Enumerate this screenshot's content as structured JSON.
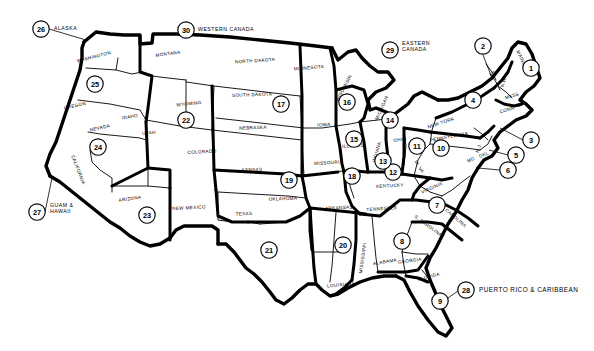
{
  "map": {
    "title": "United States Sales Territory Region Map",
    "description": "Black and white outline map of the contiguous United States divided into numbered sales regions, with state names and circled region numbers.",
    "style": {
      "background": "#ffffff",
      "line_color": "#000000",
      "text_color": "#000000"
    },
    "state_labels": [
      {
        "name": "WASHINGTON",
        "x": 94,
        "y": 57,
        "rotate": -14
      },
      {
        "name": "OREGON",
        "x": 75,
        "y": 106,
        "rotate": -13
      },
      {
        "name": "CALIFORNIA",
        "x": 78,
        "y": 170,
        "rotate": 69
      },
      {
        "name": "NEVADA",
        "x": 100,
        "y": 128,
        "rotate": -13
      },
      {
        "name": "IDAHO",
        "x": 130,
        "y": 117,
        "rotate": -10
      },
      {
        "name": "MONTANA",
        "x": 168,
        "y": 54,
        "rotate": -8
      },
      {
        "name": "WYOMING",
        "x": 189,
        "y": 104,
        "rotate": -6
      },
      {
        "name": "UTAH",
        "x": 149,
        "y": 133,
        "rotate": -5
      },
      {
        "name": "ARIZONA",
        "x": 130,
        "y": 199,
        "rotate": -8
      },
      {
        "name": "COLORADO",
        "x": 202,
        "y": 152,
        "rotate": -3
      },
      {
        "name": "NEW MEXICO",
        "x": 189,
        "y": 208,
        "rotate": -3
      },
      {
        "name": "NORTH DAKOTA",
        "x": 255,
        "y": 61,
        "rotate": -4
      },
      {
        "name": "SOUTH DAKOTA",
        "x": 252,
        "y": 95,
        "rotate": -2
      },
      {
        "name": "NEBRASKA",
        "x": 253,
        "y": 128,
        "rotate": -2
      },
      {
        "name": "KANSAS",
        "x": 252,
        "y": 170,
        "rotate": -1
      },
      {
        "name": "OKLAHOMA",
        "x": 283,
        "y": 199,
        "rotate": -2
      },
      {
        "name": "TEXAS",
        "x": 244,
        "y": 214,
        "rotate": -2
      },
      {
        "name": "MINNESOTA",
        "x": 309,
        "y": 68,
        "rotate": -5
      },
      {
        "name": "IOWA",
        "x": 324,
        "y": 125,
        "rotate": -2
      },
      {
        "name": "MISSOURI",
        "x": 327,
        "y": 163,
        "rotate": -4
      },
      {
        "name": "ARKANSAS",
        "x": 339,
        "y": 208,
        "rotate": -3
      },
      {
        "name": "LOUISIANA",
        "x": 341,
        "y": 285,
        "rotate": -5
      },
      {
        "name": "WISCONSIN",
        "x": 344,
        "y": 88,
        "rotate": -62
      },
      {
        "name": "ILLINOIS",
        "x": 353,
        "y": 146,
        "rotate": -4
      },
      {
        "name": "MICHIGAN",
        "x": 382,
        "y": 108,
        "rotate": -66
      },
      {
        "name": "INDIANA",
        "x": 377,
        "y": 152,
        "rotate": -74
      },
      {
        "name": "OHIO",
        "x": 400,
        "y": 140,
        "rotate": -6
      },
      {
        "name": "KENTUCKY",
        "x": 390,
        "y": 186,
        "rotate": -3
      },
      {
        "name": "TENNESSEE",
        "x": 382,
        "y": 209,
        "rotate": -4
      },
      {
        "name": "MISSISSIPPI",
        "x": 363,
        "y": 258,
        "rotate": -82
      },
      {
        "name": "ALABAMA",
        "x": 385,
        "y": 262,
        "rotate": -10
      },
      {
        "name": "GEORGIA",
        "x": 410,
        "y": 261,
        "rotate": -8
      },
      {
        "name": "FLORIDA",
        "x": 429,
        "y": 277,
        "rotate": -15
      },
      {
        "name": "S. CAROLINA",
        "x": 428,
        "y": 226,
        "rotate": 36
      },
      {
        "name": "N. CAROLINA",
        "x": 453,
        "y": 216,
        "rotate": 40
      },
      {
        "name": "VIRGINIA",
        "x": 432,
        "y": 188,
        "rotate": -24
      },
      {
        "name": "W. VA",
        "x": 419,
        "y": 167,
        "rotate": 58
      },
      {
        "name": "PENNSYLVANIA",
        "x": 449,
        "y": 137,
        "rotate": -11
      },
      {
        "name": "NEW YORK",
        "x": 441,
        "y": 123,
        "rotate": -18
      },
      {
        "name": "MAINE",
        "x": 521,
        "y": 58,
        "rotate": 64
      },
      {
        "name": "VT",
        "x": 493,
        "y": 74,
        "rotate": -24
      },
      {
        "name": "N.H.",
        "x": 504,
        "y": 82,
        "rotate": -72
      },
      {
        "name": "MASS",
        "x": 512,
        "y": 96,
        "rotate": -16
      },
      {
        "name": "CONN",
        "x": 507,
        "y": 110,
        "rotate": -16
      },
      {
        "name": "N.J.",
        "x": 479,
        "y": 148,
        "rotate": -70
      },
      {
        "name": "MD",
        "x": 471,
        "y": 160,
        "rotate": -20
      },
      {
        "name": "DEL",
        "x": 484,
        "y": 155,
        "rotate": -20
      }
    ],
    "region_badges": [
      {
        "number": "1",
        "x": 531,
        "y": 68,
        "r": 8.2,
        "territory": "Maine"
      },
      {
        "number": "2",
        "x": 483,
        "y": 46,
        "r": 8.2,
        "territory": "Vermont / New Hampshire"
      },
      {
        "number": "3",
        "x": 531,
        "y": 140,
        "r": 8.2,
        "territory": "Rhode Island / Connecticut"
      },
      {
        "number": "4",
        "x": 473,
        "y": 100,
        "r": 8.2,
        "territory": "New York"
      },
      {
        "number": "5",
        "x": 516,
        "y": 155,
        "r": 8.2,
        "territory": "New Jersey / Delaware"
      },
      {
        "number": "6",
        "x": 508,
        "y": 170,
        "r": 8.2,
        "territory": "Maryland / D.C."
      },
      {
        "number": "7",
        "x": 437,
        "y": 205,
        "r": 8.2,
        "territory": "Virginia / Carolinas"
      },
      {
        "number": "8",
        "x": 402,
        "y": 241,
        "r": 8.2,
        "territory": "Alabama / Georgia"
      },
      {
        "number": "9",
        "x": 440,
        "y": 301,
        "r": 8.2,
        "territory": "Florida"
      },
      {
        "number": "10",
        "x": 441,
        "y": 148,
        "r": 8.2,
        "territory": "Pennsylvania"
      },
      {
        "number": "11",
        "x": 417,
        "y": 146,
        "r": 8.2,
        "territory": "Ohio"
      },
      {
        "number": "12",
        "x": 393,
        "y": 172,
        "r": 8.2,
        "territory": "Kentucky"
      },
      {
        "number": "13",
        "x": 383,
        "y": 161,
        "r": 8.2,
        "territory": "Indiana"
      },
      {
        "number": "14",
        "x": 390,
        "y": 120,
        "r": 8.2,
        "territory": "Michigan"
      },
      {
        "number": "15",
        "x": 354,
        "y": 139,
        "r": 8.2,
        "territory": "Northern Illinois"
      },
      {
        "number": "16",
        "x": 347,
        "y": 102,
        "r": 8.2,
        "territory": "Wisconsin"
      },
      {
        "number": "17",
        "x": 281,
        "y": 104,
        "r": 8.2,
        "territory": "Dakotas / Nebraska / Minnesota / Iowa"
      },
      {
        "number": "18",
        "x": 352,
        "y": 176,
        "r": 8.2,
        "territory": "Missouri / Southern Illinois"
      },
      {
        "number": "19",
        "x": 289,
        "y": 180,
        "r": 8.2,
        "territory": "Kansas / Oklahoma"
      },
      {
        "number": "20",
        "x": 343,
        "y": 245,
        "r": 8.2,
        "territory": "Arkansas / Louisiana / Mississippi"
      },
      {
        "number": "21",
        "x": 269,
        "y": 250,
        "r": 8.2,
        "territory": "Texas"
      },
      {
        "number": "22",
        "x": 186,
        "y": 120,
        "r": 8.2,
        "territory": "Wyoming / Utah / Colorado"
      },
      {
        "number": "23",
        "x": 147,
        "y": 215,
        "r": 8.2,
        "territory": "Arizona / New Mexico"
      },
      {
        "number": "24",
        "x": 98,
        "y": 147,
        "r": 8.2,
        "territory": "Nevada / California"
      },
      {
        "number": "25",
        "x": 95,
        "y": 84,
        "r": 8.2,
        "territory": "Washington / Oregon / Idaho"
      },
      {
        "number": "26",
        "x": 41,
        "y": 29,
        "r": 8.2,
        "territory": "Alaska"
      },
      {
        "number": "27",
        "x": 37,
        "y": 212,
        "r": 8.2,
        "territory": "Guam & Hawaii"
      },
      {
        "number": "28",
        "x": 466,
        "y": 290,
        "r": 8.2,
        "territory": "Puerto Rico & Caribbean"
      },
      {
        "number": "29",
        "x": 390,
        "y": 50,
        "r": 8.2,
        "territory": "Eastern Canada"
      },
      {
        "number": "30",
        "x": 186,
        "y": 30,
        "r": 8.2,
        "territory": "Western Canada"
      }
    ],
    "offshore_legend": [
      {
        "number": "26",
        "lines": [
          "ALASKA"
        ],
        "x": 54,
        "y": 29,
        "size": "small"
      },
      {
        "number": "30",
        "lines": [
          "WESTERN CANADA"
        ],
        "x": 198,
        "y": 30,
        "size": "small"
      },
      {
        "number": "29",
        "lines": [
          "EASTERN",
          "CANADA"
        ],
        "x": 402,
        "y": 47,
        "size": "small"
      },
      {
        "number": "27",
        "lines": [
          "GUAM &",
          "HAWAII"
        ],
        "x": 50,
        "y": 209,
        "size": "small"
      },
      {
        "number": "28",
        "lines": [
          "PUERTO RICO & CARIBBEAN"
        ],
        "x": 479,
        "y": 290,
        "size": "big"
      }
    ]
  }
}
